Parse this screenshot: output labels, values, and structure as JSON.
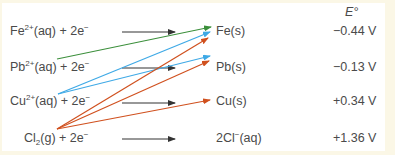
{
  "header": {
    "potential_label": "E°"
  },
  "colors": {
    "background": "#fbf7e6",
    "panel": "#ffffff",
    "text": "#4a4a4a",
    "black_arrow": "#333333",
    "green": "#3b8f3b",
    "blue": "#3ea9e6",
    "red": "#d0501e"
  },
  "rows": [
    {
      "reactant_base": "Fe",
      "reactant_charge": "2+",
      "reactant_tail": "(aq) + 2e",
      "electron_sign": "−",
      "product": "Fe(s)",
      "potential": "−0.44 V"
    },
    {
      "reactant_base": "Pb",
      "reactant_charge": "2+",
      "reactant_tail": "(aq) + 2e",
      "electron_sign": "−",
      "product": "Pb(s)",
      "potential": "−0.13 V"
    },
    {
      "reactant_base": "Cu",
      "reactant_charge": "2+",
      "reactant_tail": "(aq) + 2e",
      "electron_sign": "−",
      "product": "Cu(s)",
      "potential": "+0.34 V"
    },
    {
      "reactant_base": "Cl",
      "reactant_sub": "2",
      "reactant_tail": "(g) + 2e",
      "electron_sign": "−",
      "product_base": "2Cl",
      "product_charge": "−",
      "product_tail": "(aq)",
      "potential": "+1.36 V"
    }
  ],
  "cross_arrows": [
    {
      "from": "Pb2+",
      "to": "Fe(s)",
      "color": "green"
    },
    {
      "from": "Cu2+",
      "to": "Fe(s)",
      "color": "blue"
    },
    {
      "from": "Cu2+",
      "to": "Pb(s)",
      "color": "blue"
    },
    {
      "from": "Cl2",
      "to": "Fe(s)",
      "color": "red"
    },
    {
      "from": "Cl2",
      "to": "Pb(s)",
      "color": "red"
    },
    {
      "from": "Cl2",
      "to": "Cu(s)",
      "color": "red"
    }
  ]
}
